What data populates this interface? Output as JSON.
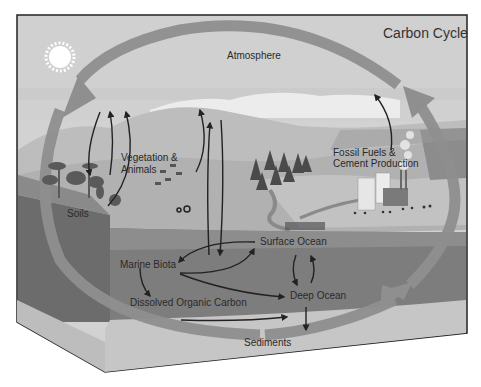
{
  "diagram": {
    "title": "Carbon Cycle",
    "top_cropped_text": "",
    "labels": {
      "atmosphere": "Atmosphere",
      "vegetation": [
        "Vegetation &",
        "Animals"
      ],
      "soils": "Soils",
      "fossil_fuels": [
        "Fossil Fuels &",
        "Cement Production"
      ],
      "surface_ocean": "Surface Ocean",
      "marine_biota": "Marine Biota",
      "dissolved_organic_carbon": "Dissolved Organic Carbon",
      "deep_ocean": "Deep Ocean",
      "sediments": "Sediments"
    },
    "icons": [
      "sun-icon",
      "tree-icon",
      "conifer-icon",
      "cow-icon",
      "tractor-icon",
      "building-icon",
      "factory-icon",
      "smoke-icon",
      "car-icon",
      "people-icon"
    ],
    "colors": {
      "sky": "#cfcfcf",
      "cloud": "#ececec",
      "hill_far": "#b9b9b9",
      "land": "#a8a8a8",
      "soil_block": "#6e6e6e",
      "ocean_surface": "#8a8a8a",
      "ocean_deep": "#7a7a7a",
      "sediment": "#c4c4c4",
      "cycle_arrow": "#8f8f8f",
      "flux_arrow": "#222222",
      "border": "#222222"
    }
  }
}
